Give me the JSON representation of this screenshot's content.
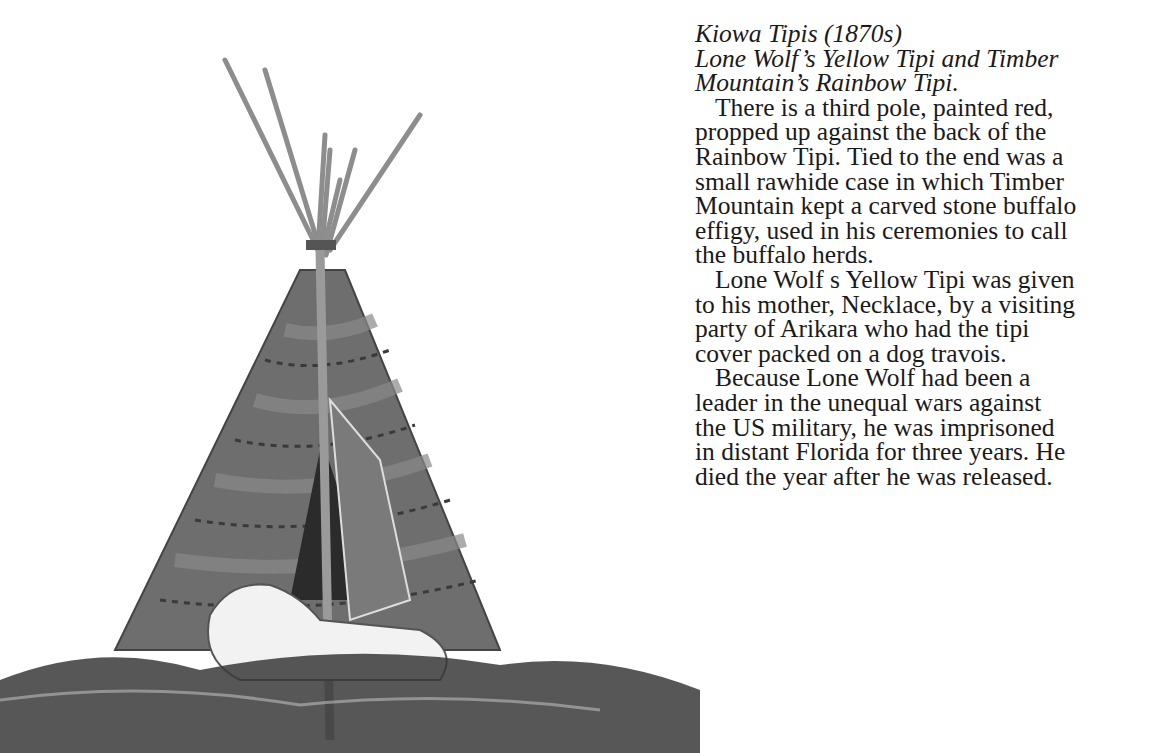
{
  "caption": {
    "title": "Kiowa Tipis (1870s)",
    "subtitle_lines": [
      "Lone Wolf’s Yellow Tipi and Timber",
      "Mountain’s Rainbow Tipi."
    ]
  },
  "paragraphs": [
    {
      "lines": [
        "There is a third pole, painted red,",
        "propped up against the back of the",
        "Rainbow Tipi. Tied to the end was a",
        "small rawhide case in which Timber",
        "Mountain kept a carved stone buffalo",
        "effigy, used in his ceremonies to call",
        "the buffalo herds."
      ]
    },
    {
      "lines": [
        "Lone Wolf s Yellow Tipi was given",
        "to his mother, Necklace, by a visiting",
        "party of Arikara who had the tipi",
        "cover packed on a dog travois."
      ]
    },
    {
      "lines": [
        "Because Lone Wolf had been a",
        "leader in the unequal wars against",
        "the US military, he was imprisoned",
        "in distant Florida for three years. He",
        "died the year after he was released."
      ]
    }
  ],
  "illustration": {
    "subject": "tipi-with-wolf-in-grass",
    "colors": {
      "cover": "#6e6e6e",
      "cover_band": "#8a8a8a",
      "pole": "#b5b5b5",
      "grass": "#3a3a3a",
      "wolf": "#f2f2f2",
      "door": "#2b2b2b"
    }
  }
}
